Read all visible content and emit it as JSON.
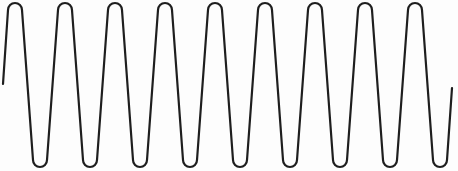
{
  "figure": {
    "stroke_color": "#1e1e1e",
    "background_color": "#fdfdfd",
    "stroke_width": 2.2,
    "start_point": [
      3,
      84
    ],
    "end_point": [
      452,
      88
    ],
    "peaks_x": [
      15,
      65,
      115,
      165,
      215,
      265,
      315,
      365,
      415
    ],
    "troughs_x": [
      40,
      90,
      140,
      190,
      240,
      290,
      340,
      390,
      440
    ],
    "peak_top_y": 3,
    "trough_bottom_y": 167,
    "peak_count": 9,
    "trough_count": 9
  }
}
